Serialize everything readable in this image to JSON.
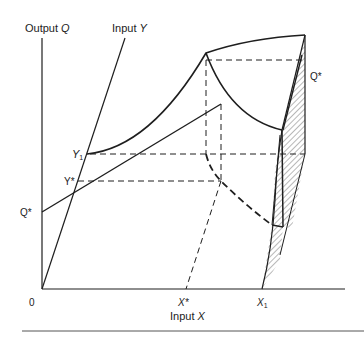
{
  "diagram": {
    "type": "production-surface",
    "axes": {
      "vertical_label_prefix": "Output ",
      "vertical_label_var": "Q",
      "oblique_label_prefix": "Input ",
      "oblique_label_var": "Y",
      "horizontal_label_prefix": "Input ",
      "horizontal_label_var": "X",
      "origin": "0"
    },
    "ticks": {
      "y1_var": "Y",
      "y1_sub": "1",
      "ystar": "Y*",
      "qstar_left": "Q*",
      "qstar_right": "Q*",
      "xstar": "X*",
      "x1_var": "X",
      "x1_sub": "1"
    },
    "colors": {
      "ink": "#1e1e1e",
      "background": "#ffffff",
      "rule": "#555555"
    }
  }
}
